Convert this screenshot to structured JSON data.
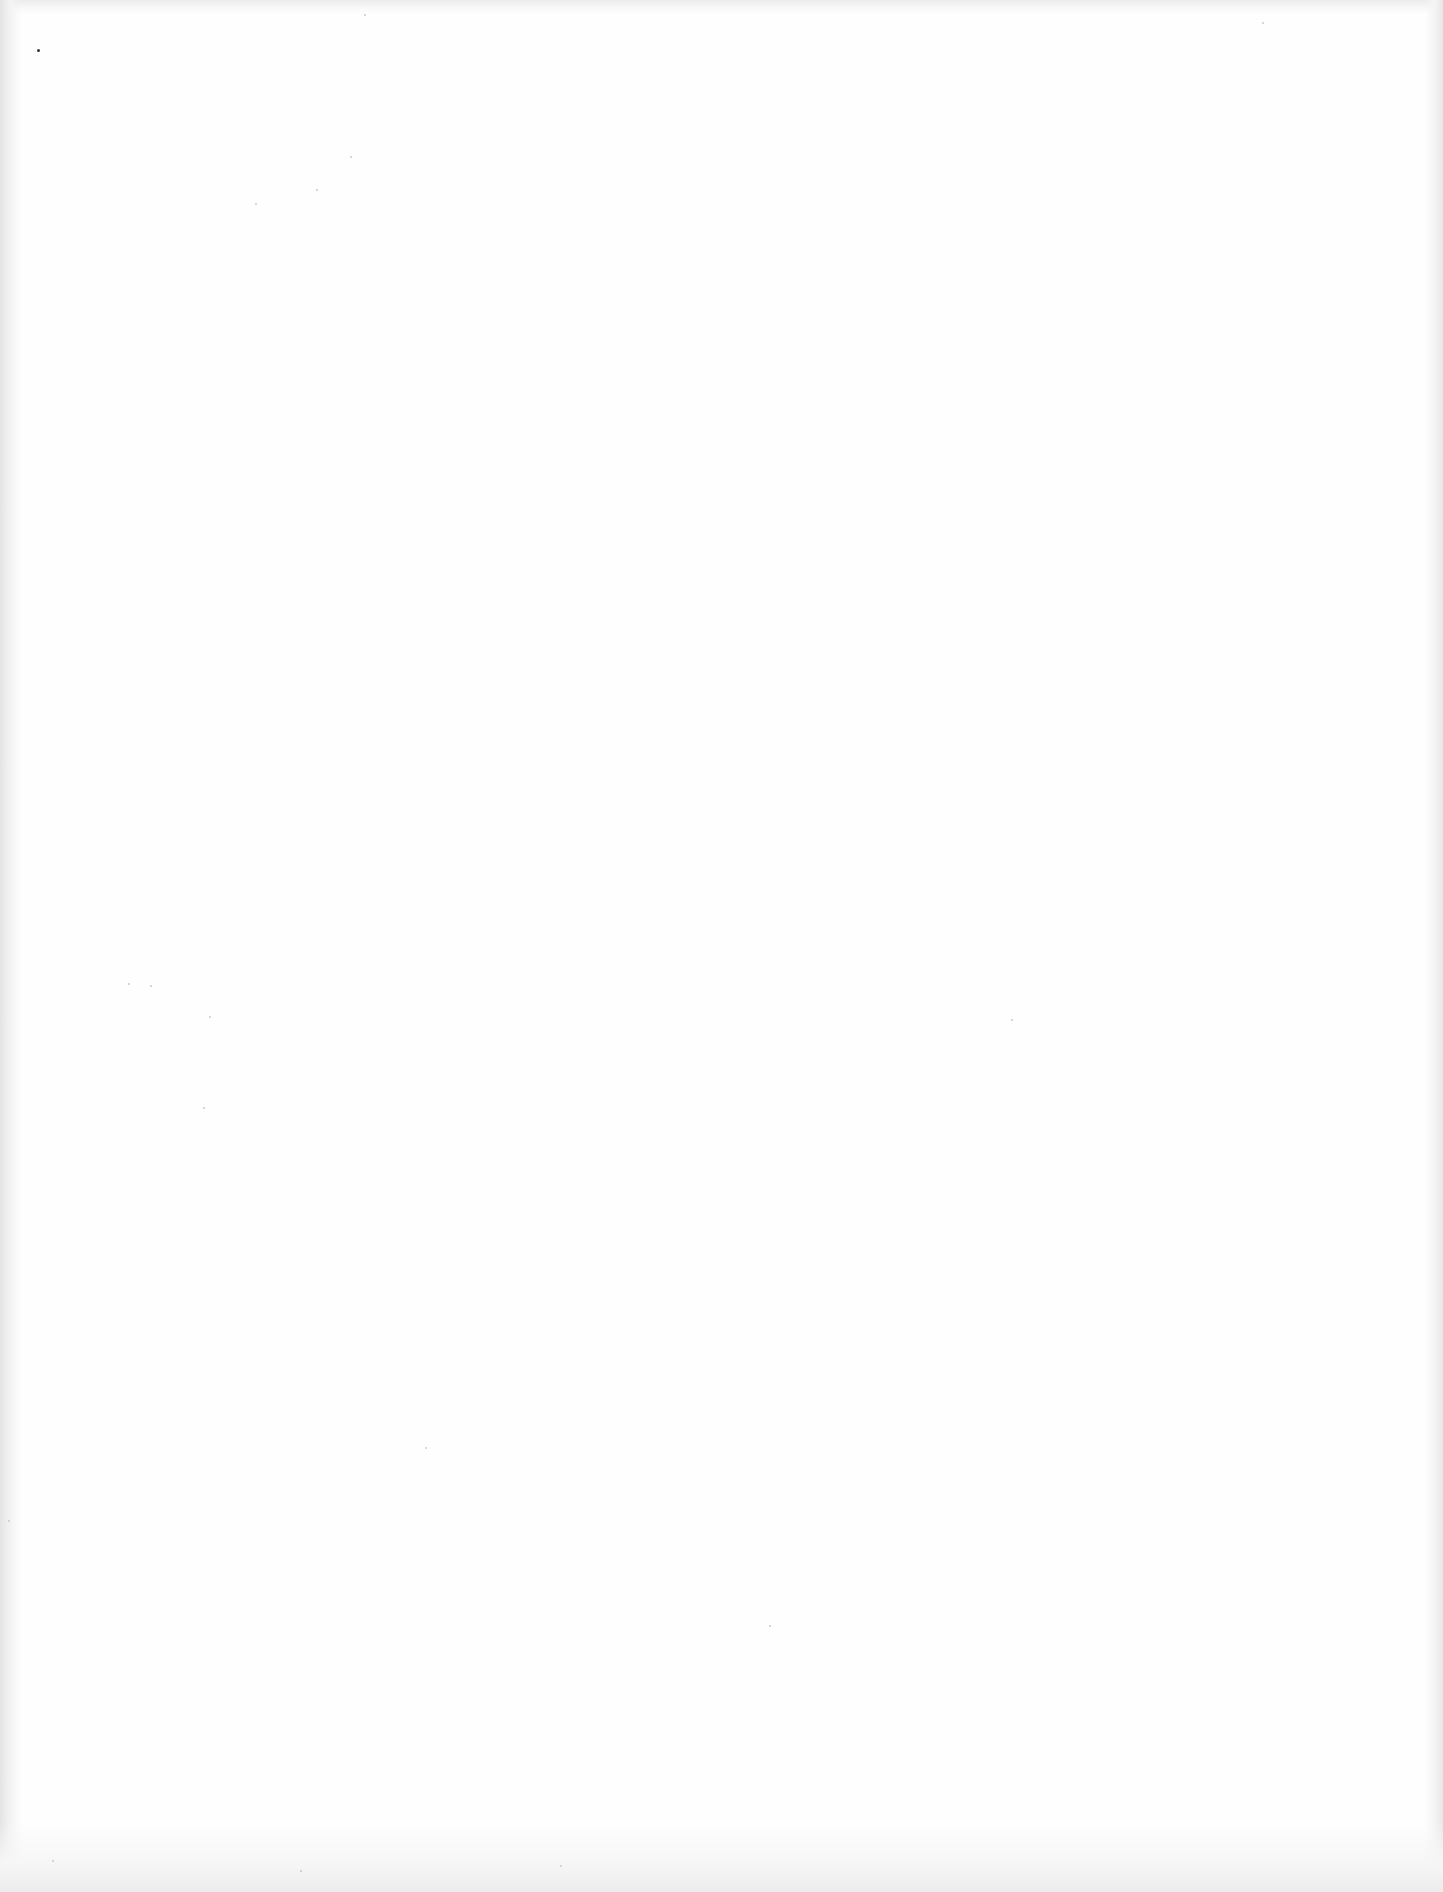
{
  "document": {
    "type": "scanned-page",
    "is_blank": true,
    "background_color": "#fefefe",
    "edge_shadow_color": "#e4e4e4",
    "text_blocks": [],
    "headings": [],
    "figures": []
  }
}
